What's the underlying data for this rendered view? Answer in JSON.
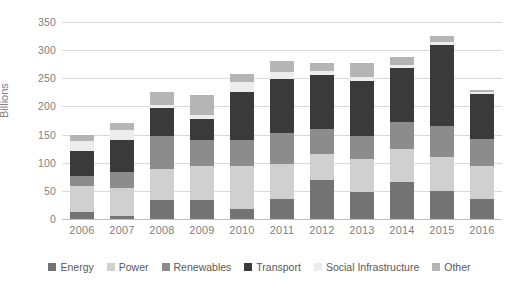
{
  "chart_data": {
    "type": "bar",
    "subtype": "stacked-column",
    "title": "",
    "xlabel": "",
    "ylabel": "Billions",
    "ylim": [
      0,
      350
    ],
    "ytick_step": 50,
    "yticks": [
      "0",
      "50",
      "100",
      "150",
      "200",
      "250",
      "300",
      "350"
    ],
    "grid": true,
    "legend_position": "bottom",
    "categories": [
      "2006",
      "2007",
      "2008",
      "2009",
      "2010",
      "2011",
      "2012",
      "2013",
      "2014",
      "2015",
      "2016"
    ],
    "series": [
      {
        "name": "Energy",
        "color": "#737373",
        "values": [
          12,
          5,
          33,
          34,
          18,
          35,
          70,
          48,
          65,
          50,
          36
        ]
      },
      {
        "name": "Power",
        "color": "#d0d0d0",
        "values": [
          47,
          50,
          55,
          60,
          77,
          62,
          45,
          58,
          60,
          60,
          58
        ]
      },
      {
        "name": "Renewables",
        "color": "#8c8c8c",
        "values": [
          18,
          28,
          60,
          46,
          45,
          55,
          45,
          42,
          48,
          55,
          48
        ]
      },
      {
        "name": "Transport",
        "color": "#3a3a3a",
        "values": [
          43,
          57,
          50,
          38,
          85,
          97,
          95,
          98,
          95,
          145,
          80
        ]
      },
      {
        "name": "Social Infrastructure",
        "color": "#ededed",
        "values": [
          18,
          18,
          5,
          7,
          18,
          12,
          8,
          6,
          5,
          5,
          4
        ]
      },
      {
        "name": "Other",
        "color": "#b5b5b5",
        "values": [
          12,
          12,
          22,
          35,
          15,
          20,
          15,
          25,
          15,
          10,
          3
        ]
      }
    ],
    "totals": [
      150,
      170,
      225,
      220,
      258,
      281,
      278,
      277,
      288,
      325,
      229
    ]
  },
  "legend": {
    "items": [
      {
        "label": "Energy"
      },
      {
        "label": "Power"
      },
      {
        "label": "Renewables"
      },
      {
        "label": "Transport"
      },
      {
        "label": "Social Infrastructure"
      },
      {
        "label": "Other"
      }
    ]
  }
}
